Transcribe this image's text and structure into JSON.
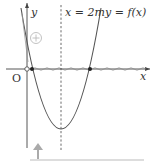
{
  "diagram": {
    "axes": {
      "y_label": "y",
      "x_label": "x",
      "origin_label": "O"
    },
    "annotations": {
      "vertical_line_label": "x = 2m",
      "curve_label": "y = f(x)",
      "sign_symbol": "+"
    },
    "colors": {
      "curve": "#555555",
      "axis": "#444444",
      "dashed": "#444444",
      "sign_circle": "#bbbbbb",
      "arrow": "#aaaaaa",
      "baseline": "#bbbbbb",
      "points": "#222222"
    },
    "icons": {
      "sign": "circled-plus-icon",
      "arrow": "up-arrow-icon"
    }
  }
}
